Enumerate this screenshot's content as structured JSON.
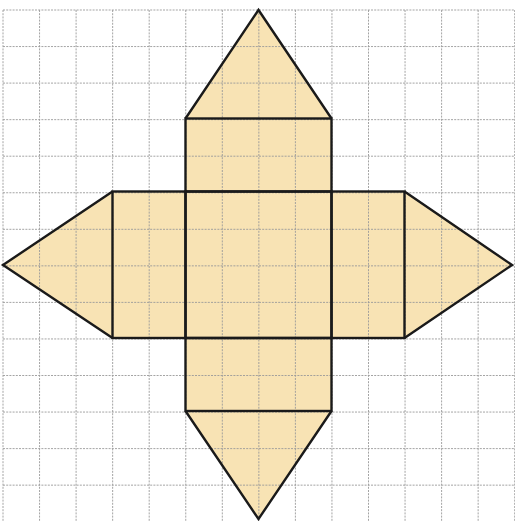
{
  "diagram": {
    "type": "pyramid-net-on-grid",
    "colors": {
      "background": "#ffffff",
      "grid_line": "#9a9a9a",
      "fill": "#f8e3b4",
      "outline": "#1a1a1a",
      "stray_line_blue": "#8a8fd6",
      "stray_line_yellow": "#f2ec9a"
    },
    "grid": {
      "origin_x": 3,
      "origin_y": 10,
      "cell": 36.55,
      "cols": 14,
      "rows": 14
    },
    "shapes": [
      {
        "name": "center-square",
        "kind": "rect",
        "x": 185.5,
        "y": 191.5,
        "w": 146,
        "h": 146.5
      },
      {
        "name": "top-rectangle",
        "kind": "rect",
        "x": 185.5,
        "y": 118.5,
        "w": 146,
        "h": 73
      },
      {
        "name": "top-triangle",
        "kind": "polygon",
        "points": [
          [
            185.5,
            118.5
          ],
          [
            258.5,
            10
          ],
          [
            331.5,
            118.5
          ]
        ]
      },
      {
        "name": "bottom-rectangle",
        "kind": "rect",
        "x": 185.5,
        "y": 338,
        "w": 146,
        "h": 73
      },
      {
        "name": "bottom-triangle",
        "kind": "polygon",
        "points": [
          [
            185.5,
            411
          ],
          [
            258.5,
            519
          ],
          [
            331.5,
            411
          ]
        ]
      },
      {
        "name": "left-rectangle",
        "kind": "rect",
        "x": 112.5,
        "y": 191.5,
        "w": 73,
        "h": 146.5
      },
      {
        "name": "left-triangle",
        "kind": "polygon",
        "points": [
          [
            112.5,
            191.5
          ],
          [
            3,
            265
          ],
          [
            112.5,
            338
          ]
        ]
      },
      {
        "name": "right-rectangle",
        "kind": "rect",
        "x": 331.5,
        "y": 191.5,
        "w": 73,
        "h": 146.5
      },
      {
        "name": "right-triangle",
        "kind": "polygon",
        "points": [
          [
            404.5,
            191.5
          ],
          [
            512,
            265
          ],
          [
            404.5,
            338
          ]
        ]
      }
    ],
    "stray_line": {
      "x1": 255,
      "x2": 515,
      "y": 486
    }
  }
}
